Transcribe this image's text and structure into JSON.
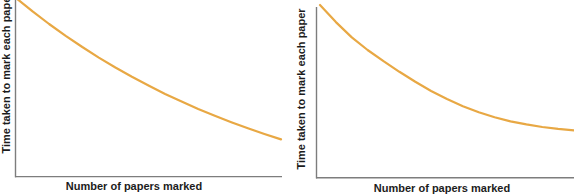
{
  "figure": {
    "background": "#ffffff",
    "axis_color": "#7d7d7d",
    "text_color": "#1c1c1c",
    "curve_color": "#E8A844"
  },
  "chart_data": [
    {
      "type": "line",
      "title": "",
      "xlabel": "Number of papers marked",
      "ylabel": "Time taken to mark each paper",
      "x_axis": {
        "ticks": "none",
        "tick_labels": "none",
        "range_norm": [
          0,
          1
        ]
      },
      "y_axis": {
        "ticks": "none",
        "tick_labels": "none",
        "range_norm": [
          0,
          1
        ]
      },
      "grid": false,
      "legend": false,
      "shape_note": "smooth decreasing curve, still sloping downward at right edge (top of plot clipped by image edge)",
      "series": [
        {
          "name": "marking-time",
          "color": "#E8A844",
          "x": [
            0,
            0.0625,
            0.125,
            0.1875,
            0.25,
            0.3125,
            0.375,
            0.4375,
            0.5,
            0.5625,
            0.625,
            0.6875,
            0.75,
            0.8125,
            0.875,
            0.9375,
            1.0
          ],
          "y": [
            1.0,
            0.925,
            0.855,
            0.789,
            0.726,
            0.667,
            0.612,
            0.56,
            0.511,
            0.464,
            0.421,
            0.38,
            0.342,
            0.306,
            0.272,
            0.24,
            0.21
          ]
        }
      ]
    },
    {
      "type": "line",
      "title": "",
      "xlabel": "Number of papers marked",
      "ylabel": "Time taken to mark each paper",
      "x_axis": {
        "ticks": "none",
        "tick_labels": "none",
        "range_norm": [
          0,
          1
        ]
      },
      "y_axis": {
        "ticks": "none",
        "tick_labels": "none",
        "range_norm": [
          0,
          1
        ]
      },
      "grid": false,
      "legend": false,
      "shape_note": "steep exponential-style decay levelling off to a flat asymptote (right side clipped by image edge)",
      "series": [
        {
          "name": "marking-time",
          "color": "#E8A844",
          "x": [
            0,
            0.0625,
            0.125,
            0.1875,
            0.25,
            0.3125,
            0.375,
            0.4375,
            0.5,
            0.5625,
            0.625,
            0.6875,
            0.75,
            0.8125,
            0.875,
            0.9375,
            1.0
          ],
          "y": [
            1.0,
            0.901,
            0.813,
            0.74,
            0.675,
            0.614,
            0.556,
            0.503,
            0.456,
            0.415,
            0.38,
            0.351,
            0.327,
            0.31,
            0.295,
            0.284,
            0.275
          ]
        }
      ]
    }
  ]
}
